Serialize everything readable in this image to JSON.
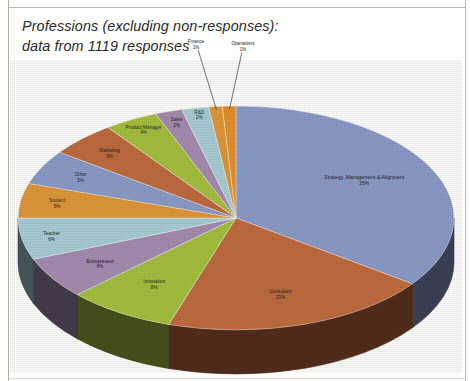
{
  "title": "Professions (excluding non-responses):\ndata from 1119 responses",
  "chart_data": {
    "type": "pie",
    "title": "Professions (excluding non-responses): data from 1119 responses",
    "total_responses": 1119,
    "legend_position": "none",
    "data_labels": "category name and percentage",
    "three_d": true,
    "categories": [
      "Strategy, Management & Alignment",
      "Consultant",
      "Innovation",
      "Entrepreneur",
      "Teacher",
      "Student",
      "Other",
      "Marketing",
      "Product Manager",
      "Sales",
      "R&D",
      "Finance",
      "Operations"
    ],
    "values": [
      35,
      20,
      8,
      6,
      6,
      5,
      5,
      5,
      4,
      2,
      2,
      1,
      1
    ],
    "value_unit": "percent",
    "colors": [
      "#8c9bc8",
      "#c06b3e",
      "#a4c03e",
      "#a58cb0",
      "#a8cdd6",
      "#e09838",
      "#8c9bc8",
      "#c06b3e",
      "#a4c03e",
      "#a58cb0",
      "#a8cdd6",
      "#e09838",
      "#e8912a"
    ],
    "slices": [
      {
        "label": "Strategy, Management & Alignment",
        "pct_label": "35%",
        "value": 35,
        "color": "#8c9bc8"
      },
      {
        "label": "Consultant",
        "pct_label": "20%",
        "value": 20,
        "color": "#c06b3e"
      },
      {
        "label": "Innovation",
        "pct_label": "8%",
        "value": 8,
        "color": "#a4c03e"
      },
      {
        "label": "Entrepreneur",
        "pct_label": "6%",
        "value": 6,
        "color": "#a58cb0"
      },
      {
        "label": "Teacher",
        "pct_label": "6%",
        "value": 6,
        "color": "#a8cdd6"
      },
      {
        "label": "Student",
        "pct_label": "5%",
        "value": 5,
        "color": "#e09838"
      },
      {
        "label": "Other",
        "pct_label": "5%",
        "value": 5,
        "color": "#8c9bc8"
      },
      {
        "label": "Marketing",
        "pct_label": "5%",
        "value": 5,
        "color": "#c06b3e"
      },
      {
        "label": "Product Manager",
        "pct_label": "4%",
        "value": 4,
        "color": "#a4c03e"
      },
      {
        "label": "Sales",
        "pct_label": "2%",
        "value": 2,
        "color": "#a58cb0"
      },
      {
        "label": "R&D",
        "pct_label": "2%",
        "value": 2,
        "color": "#a8cdd6"
      },
      {
        "label": "Finance",
        "pct_label": "1%",
        "value": 1,
        "color": "#e09838"
      },
      {
        "label": "Operations",
        "pct_label": "1%",
        "value": 1,
        "color": "#e8912a"
      }
    ]
  }
}
